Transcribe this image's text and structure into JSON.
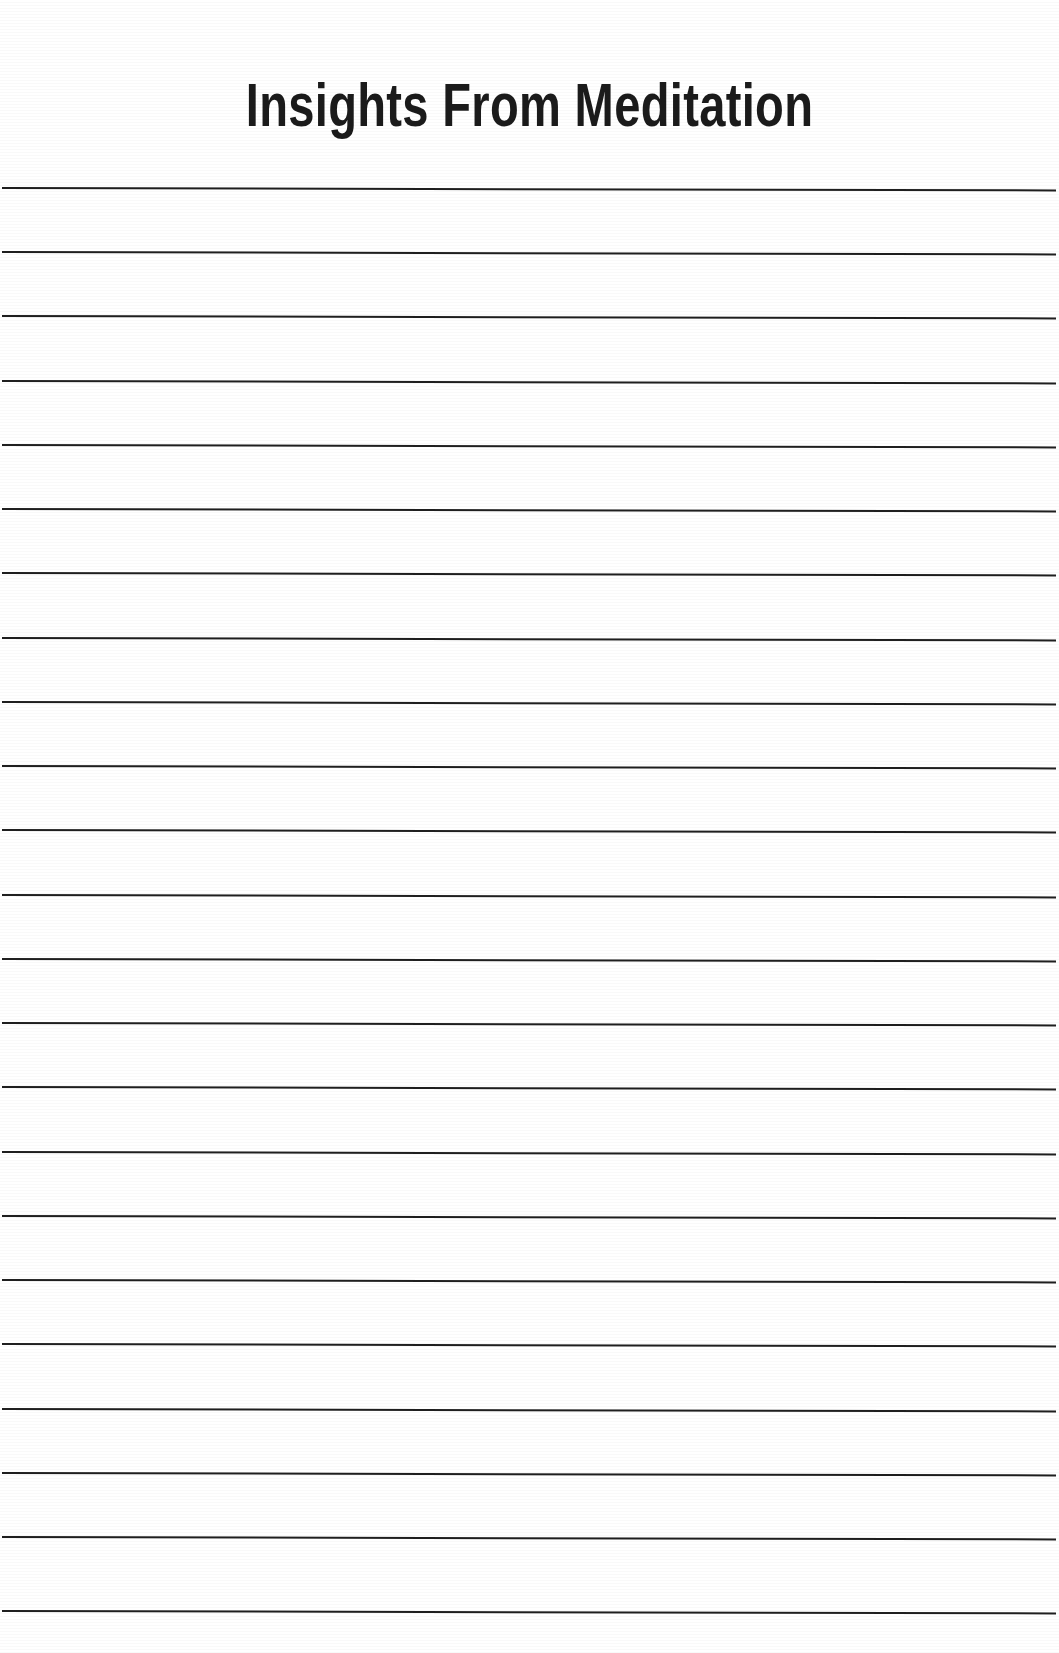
{
  "page": {
    "width": 1059,
    "height": 1653,
    "background_color": "#ffffff",
    "kind": "printable-lined-notes-page"
  },
  "header": {
    "title": "Insights From Meditation",
    "title_color": "#1b1b1b",
    "title_baseline_y": 136,
    "title_font_size_px": 62,
    "title_weight": "bold",
    "title_alignment": "center"
  },
  "ruled_lines": {
    "count": 23,
    "color": "#1f1f1f",
    "thickness_px": 2,
    "left_x": 2,
    "right_x": 1056,
    "first_line_y": 187,
    "line_spacing_px": 64.2,
    "y_positions": [
      187,
      251,
      315,
      380,
      444,
      508,
      572,
      637,
      701,
      765,
      829,
      894,
      958,
      1022,
      1086,
      1151,
      1215,
      1279,
      1343,
      1408,
      1472,
      1536,
      1610
    ]
  }
}
